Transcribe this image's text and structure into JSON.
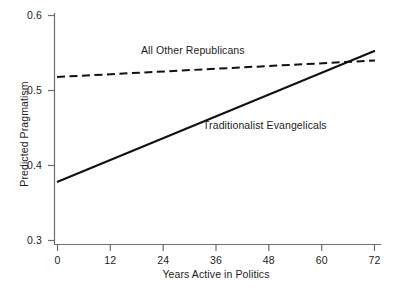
{
  "chart_data": {
    "type": "line",
    "title": "",
    "xlabel": "Years Active in Politics",
    "ylabel": "Predicted Pragmatism",
    "xlim": [
      0,
      72
    ],
    "ylim": [
      0.3,
      0.6
    ],
    "xticks": [
      "0",
      "12",
      "24",
      "36",
      "48",
      "60",
      "72"
    ],
    "yticks": [
      "0.3",
      "0.4",
      "0.5",
      "0.6"
    ],
    "xtick_values": [
      0,
      12,
      24,
      36,
      48,
      60,
      72
    ],
    "ytick_values": [
      0.3,
      0.4,
      0.5,
      0.6
    ],
    "grid": false,
    "legend_position": "inline-annotations",
    "x": [
      0,
      72
    ],
    "series": [
      {
        "name": "All Other Republicans",
        "style": "dashed",
        "color": "#111111",
        "values": [
          0.518,
          0.54
        ]
      },
      {
        "name": "Traditionalist Evangelicals",
        "style": "solid",
        "color": "#111111",
        "values": [
          0.378,
          0.553
        ]
      }
    ],
    "annotations": [
      {
        "text": "All Other Republicans",
        "x": 24,
        "y": 0.563
      },
      {
        "text": "Traditionalist Evangelicals",
        "x": 38,
        "y": 0.466
      }
    ],
    "crossing_point": {
      "x": 66,
      "y": 0.538
    }
  },
  "axes": {
    "x_title": "Years Active in Politics",
    "y_title": "Predicted Pragmatism",
    "x_ticks": [
      {
        "label": "0"
      },
      {
        "label": "12"
      },
      {
        "label": "24"
      },
      {
        "label": "36"
      },
      {
        "label": "48"
      },
      {
        "label": "60"
      },
      {
        "label": "72"
      }
    ],
    "y_ticks": [
      {
        "label": "0.6"
      },
      {
        "label": "0.5"
      },
      {
        "label": "0.4"
      },
      {
        "label": "0.3"
      }
    ]
  },
  "annotations": {
    "other_republicans": "All Other Republicans",
    "traditionalist_evangelicals": "Traditionalist Evangelicals"
  },
  "colors": {
    "axis": "#6d6d6d",
    "line": "#111111",
    "text": "#1c1c1c",
    "background": "#ffffff"
  }
}
